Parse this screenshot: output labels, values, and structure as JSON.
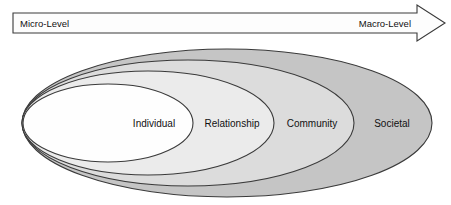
{
  "diagram": {
    "continuum_arrow": {
      "icon": "right-arrow-icon",
      "left_label": "Micro-Level",
      "right_label": "Macro-Level",
      "fill_color": "#fdfdfd",
      "stroke_color": "#3a3a3a"
    },
    "levels": [
      {
        "label": "Societal",
        "order": 4,
        "fill_color": "#c5c5c5",
        "stroke_color": "#3a3a3a",
        "label_x": 392,
        "rx": 205,
        "ry": 74,
        "cx": 227,
        "cy": 123
      },
      {
        "label": "Community",
        "order": 3,
        "fill_color": "#dcdcdc",
        "stroke_color": "#3a3a3a",
        "label_x": 312,
        "rx": 166,
        "ry": 63,
        "cx": 188,
        "cy": 123
      },
      {
        "label": "Relationship",
        "order": 2,
        "fill_color": "#ebebeb",
        "stroke_color": "#3a3a3a",
        "label_x": 232,
        "rx": 126,
        "ry": 52,
        "cx": 148,
        "cy": 123
      },
      {
        "label": "Individual",
        "order": 1,
        "fill_color": "#fefefe",
        "stroke_color": "#3a3a3a",
        "label_x": 154,
        "rx": 85,
        "ry": 39,
        "cx": 108,
        "cy": 123
      }
    ]
  }
}
